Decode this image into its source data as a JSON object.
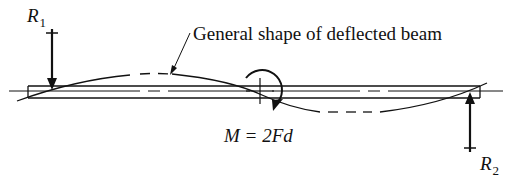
{
  "diagram": {
    "type": "beam-deflection",
    "caption": "General shape of deflected beam",
    "moment_label": "M = 2Fd",
    "reactions": [
      {
        "name": "R",
        "subscript": "1",
        "direction": "down",
        "position": "left support"
      },
      {
        "name": "R",
        "subscript": "2",
        "direction": "up",
        "position": "right support"
      }
    ],
    "applied_load": {
      "kind": "couple",
      "symbol": "M",
      "value": "2Fd",
      "rotation": "clockwise",
      "position": "mid-span"
    },
    "colors": {
      "ink": "#111111",
      "background": "#ffffff"
    }
  }
}
